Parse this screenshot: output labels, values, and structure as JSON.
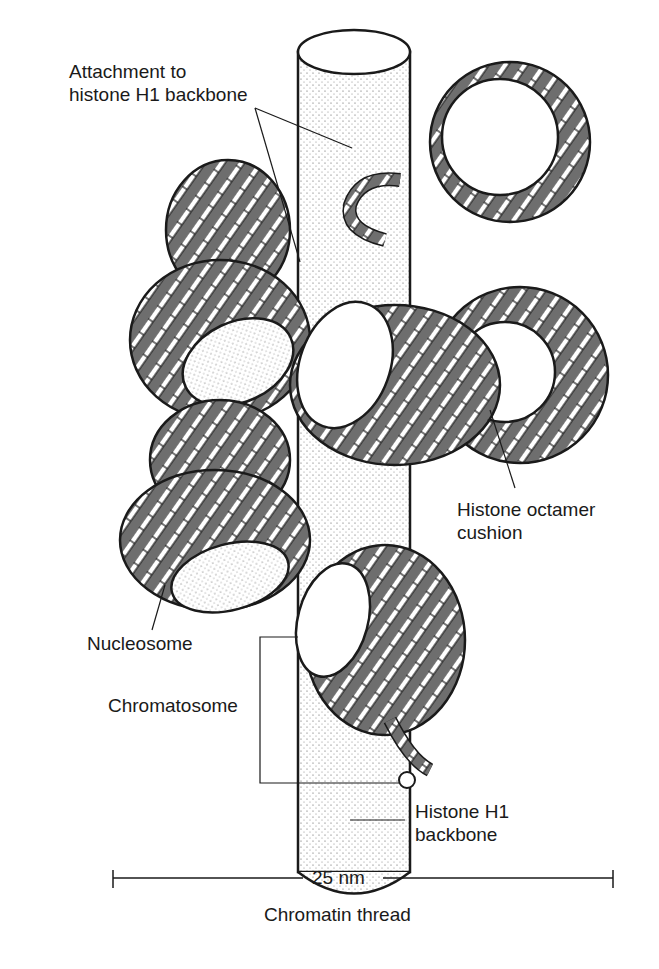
{
  "figure": {
    "title": "Chromatin thread",
    "scale_label": "25 nm",
    "labels": {
      "attachment_line1": "Attachment to",
      "attachment_line2": "histone H1 backbone",
      "octamer_line1": "Histone octamer",
      "octamer_line2": "cushion",
      "nucleosome": "Nucleosome",
      "chromatosome": "Chromatosome",
      "backbone_line1": "Histone H1",
      "backbone_line2": "backbone"
    },
    "colors": {
      "ink": "#1a1a1a",
      "dna_dark": "#6e6e6e",
      "dna_light": "#ffffff",
      "cylinder_fill": "#f4f4f4"
    }
  }
}
